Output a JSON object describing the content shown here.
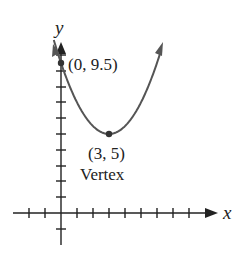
{
  "chart_data": {
    "type": "line",
    "title": "",
    "xlabel": "x",
    "ylabel": "y",
    "function": "y = 0.5(x - 3)^2 + 5",
    "xlim": [
      -2,
      9.5
    ],
    "ylim": [
      -1,
      10.5
    ],
    "x_ticks": [
      -2,
      -1,
      1,
      2,
      3,
      4,
      5,
      6,
      7,
      8
    ],
    "y_ticks": [
      -1,
      1,
      2,
      3,
      4,
      5,
      6,
      7,
      8,
      9,
      10
    ],
    "series": [
      {
        "name": "parabola",
        "x": [
          -0.5,
          0,
          1,
          2,
          3,
          4,
          5,
          6,
          6.3
        ],
        "y": [
          11.125,
          9.5,
          7,
          5.5,
          5,
          5.5,
          7,
          9.5,
          10.445
        ]
      }
    ],
    "points": [
      {
        "x": 0,
        "y": 9.5,
        "label": "(0, 9.5)"
      },
      {
        "x": 3,
        "y": 5,
        "label": "(3, 5)",
        "annotation": "Vertex"
      }
    ],
    "grid": false,
    "legend": null
  },
  "labels": {
    "x_axis": "x",
    "y_axis": "y",
    "y_intercept": "(0, 9.5)",
    "vertex_coords": "(3, 5)",
    "vertex_word": "Vertex"
  },
  "colors": {
    "axis": "#222222",
    "curve": "#555555",
    "point": "#333333"
  }
}
